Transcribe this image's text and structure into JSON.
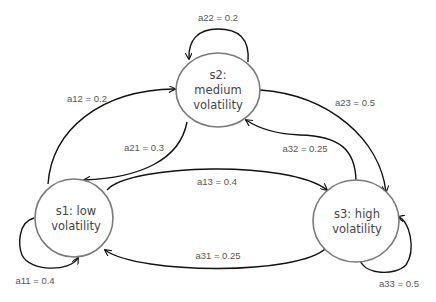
{
  "diagram": {
    "type": "markov-state-transition",
    "states": [
      {
        "id": "s1",
        "line1": "s1: low",
        "line2": "volatility"
      },
      {
        "id": "s2",
        "line1": "s2:",
        "line2": "medium",
        "line3": "volatility"
      },
      {
        "id": "s3",
        "line1": "s3: high",
        "line2": "volatility"
      }
    ],
    "transitions": {
      "a11": {
        "from": "s1",
        "to": "s1",
        "label": "a11 = 0.4",
        "value": 0.4
      },
      "a12": {
        "from": "s1",
        "to": "s2",
        "label": "a12 = 0.2",
        "value": 0.2
      },
      "a13": {
        "from": "s1",
        "to": "s3",
        "label": "a13 = 0.4",
        "value": 0.4
      },
      "a21": {
        "from": "s2",
        "to": "s1",
        "label": "a21 = 0.3",
        "value": 0.3
      },
      "a22": {
        "from": "s2",
        "to": "s2",
        "label": "a22 = 0.2",
        "value": 0.2
      },
      "a23": {
        "from": "s2",
        "to": "s3",
        "label": "a23 = 0.5",
        "value": 0.5
      },
      "a31": {
        "from": "s3",
        "to": "s1",
        "label": "a31 = 0.25",
        "value": 0.25
      },
      "a32": {
        "from": "s3",
        "to": "s2",
        "label": "a32 = 0.25",
        "value": 0.25
      },
      "a33": {
        "from": "s3",
        "to": "s3",
        "label": "a33 = 0.5",
        "value": 0.5
      }
    },
    "colors": {
      "state_stroke": "#7a7a7a",
      "edge_stroke": "#111111",
      "text": "#555555",
      "background": "#ffffff"
    }
  }
}
